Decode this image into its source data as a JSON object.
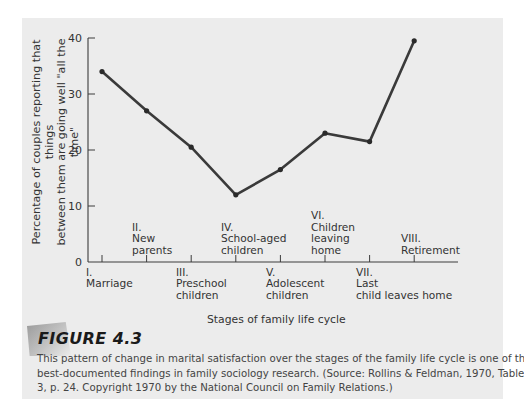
{
  "chart_data": {
    "type": "line",
    "title": "",
    "xlabel": "Stages of family life cycle",
    "ylabel": "Percentage of couples reporting that things between them are going well \"all the time\"",
    "ylabel_lines": [
      "Percentage of couples reporting that things",
      "between them are going well \"all the time\""
    ],
    "ylim": [
      0,
      40
    ],
    "yticks": [
      0,
      10,
      20,
      30,
      40
    ],
    "grid": false,
    "legend": null,
    "categories": [
      "I. Marriage",
      "II. New parents",
      "III. Preschool children",
      "IV. School-aged children",
      "V. Adolescent children",
      "VI. Children leaving home",
      "VII. Last child leaves home",
      "VIII. Retirement"
    ],
    "series": [
      {
        "name": "Couples reporting things going well all the time (%)",
        "values": [
          34,
          27,
          20.5,
          12,
          16.5,
          23,
          21.5,
          39.5
        ]
      }
    ],
    "stage_labels": [
      {
        "numeral": "I.",
        "lines": [
          "Marriage"
        ],
        "position": "below"
      },
      {
        "numeral": "II.",
        "lines": [
          "New",
          "parents"
        ],
        "position": "above"
      },
      {
        "numeral": "III.",
        "lines": [
          "Preschool",
          "children"
        ],
        "position": "below"
      },
      {
        "numeral": "IV.",
        "lines": [
          "School-aged",
          "children"
        ],
        "position": "above"
      },
      {
        "numeral": "V.",
        "lines": [
          "Adolescent",
          "children"
        ],
        "position": "below"
      },
      {
        "numeral": "VI.",
        "lines": [
          "Children",
          "leaving",
          "home"
        ],
        "position": "above"
      },
      {
        "numeral": "VII.",
        "lines": [
          "Last",
          "child leaves home"
        ],
        "position": "below"
      },
      {
        "numeral": "VIII.",
        "lines": [
          "Retirement"
        ],
        "position": "above"
      }
    ],
    "line_color": "#3a3a3a"
  },
  "figure": {
    "label": "FIGURE 4.3",
    "caption_lines": [
      "This pattern of change in marital satisfaction over the stages of the family life cycle is one of the",
      "best-documented findings in family sociology research. (Source: Rollins & Feldman, 1970, Tables 2 &",
      "3, p. 24. Copyright 1970 by the National Council on Family Relations.)"
    ]
  }
}
